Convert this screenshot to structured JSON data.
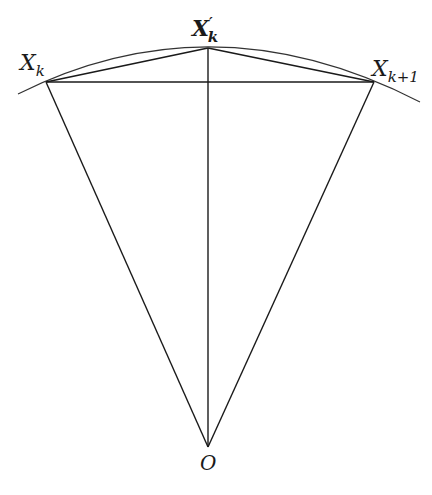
{
  "diagram": {
    "colors": {
      "stroke": "#1a1a1a",
      "arc": "#333333",
      "background": "#ffffff"
    },
    "points": {
      "Xk": {
        "label": "X",
        "sub": "k",
        "x": 46,
        "y": 82
      },
      "Xk_prime": {
        "label": "X",
        "sup": "′",
        "sub": "k",
        "x": 208,
        "y": 48
      },
      "Xk1": {
        "label": "X",
        "sub": "k+1",
        "x": 374,
        "y": 82
      },
      "O": {
        "label": "O",
        "x": 208,
        "y": 447
      }
    },
    "arc": {
      "center": "O",
      "from": [
        18,
        94
      ],
      "to": [
        420,
        102
      ]
    },
    "segments": [
      [
        "Xk",
        "Xk1"
      ],
      [
        "Xk",
        "Xk_prime"
      ],
      [
        "Xk_prime",
        "Xk1"
      ],
      [
        "Xk",
        "O"
      ],
      [
        "Xk1",
        "O"
      ],
      [
        "Xk_prime",
        "O"
      ]
    ]
  }
}
